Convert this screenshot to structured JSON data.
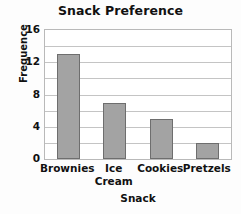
{
  "chart_data": {
    "type": "bar",
    "title": "Snack Preference",
    "xlabel": "Snack",
    "ylabel": "Frequence",
    "categories": [
      "Brownies",
      "Ice Cream",
      "Cookies",
      "Pretzels"
    ],
    "category_lines": [
      [
        "Brownies"
      ],
      [
        "Ice",
        "Cream"
      ],
      [
        "Cookies"
      ],
      [
        "Pretzels"
      ]
    ],
    "values": [
      13,
      7,
      5,
      2
    ],
    "ylim": [
      0,
      16
    ],
    "ytick_labels": [
      "0",
      "4",
      "8",
      "12",
      "16"
    ],
    "ytick_values": [
      0,
      4,
      8,
      12,
      16
    ],
    "gridline_values": [
      2,
      4,
      6,
      8,
      10,
      12,
      14
    ],
    "grid": true,
    "legend": "none",
    "colors": {
      "bar_fill": "#a3a3a3",
      "bar_edge": "#6e6e6e",
      "grid": "#c4c4c4",
      "frame": "#b9b9b9",
      "text": "#111111",
      "background": "#fdfdfd"
    }
  }
}
